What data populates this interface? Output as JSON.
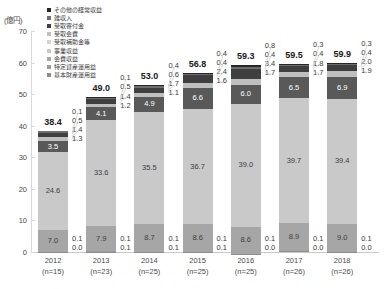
{
  "chart": {
    "type": "bar",
    "unit_label": "(億円)",
    "title": "",
    "xlabel": "",
    "ylabel": ""
  },
  "legend": {
    "items": [
      {
        "label": "その他の経常収益",
        "color": "#262626"
      },
      {
        "label": "雑収入",
        "color": "#6e6e6e"
      },
      {
        "label": "受取寄付金",
        "color": "#3f3f3f"
      },
      {
        "label": "受取会費",
        "color": "#bfbfbf"
      },
      {
        "label": "受取補助金等",
        "color": "#d4d4d4"
      },
      {
        "label": "事業収益",
        "color": "#c9c9c9"
      },
      {
        "label": "会費収益",
        "color": "#a6a6a6"
      },
      {
        "label": "特定資産運用益",
        "color": "#9c9c9c"
      },
      {
        "label": "基本財産運用益",
        "color": "#8c8c8c"
      }
    ]
  },
  "yaxis": {
    "min": 0,
    "max": 70,
    "ticks": [
      "0",
      "10",
      "20",
      "30",
      "40",
      "50",
      "60",
      "70"
    ]
  },
  "chart_data": {
    "type": "bar",
    "stacked": true,
    "title": "",
    "xlabel": "",
    "ylabel": "億円",
    "ylim": [
      0,
      70
    ],
    "grid": false,
    "legend_position": "top-left",
    "categories": [
      "2012",
      "2013",
      "2014",
      "2015",
      "2016",
      "2017",
      "2018"
    ],
    "category_sublabels": [
      "(n=15)",
      "(n=23)",
      "(n=25)",
      "(n=25)",
      "(n=25)",
      "(n=26)",
      "(n=26)"
    ],
    "totals": [
      38.4,
      49.0,
      53.0,
      56.8,
      59.3,
      59.5,
      59.9
    ],
    "series": [
      {
        "name": "基本財産運用益",
        "color": "#8c8c8c",
        "values": [
          0.1,
          0.1,
          0.1,
          0.1,
          0.1,
          0.1,
          0.1
        ]
      },
      {
        "name": "特定資産運用益",
        "color": "#9c9c9c",
        "values": [
          0.0,
          0.1,
          0.1,
          0.1,
          0.0,
          0.0,
          0.0
        ]
      },
      {
        "name": "会費収益",
        "color": "#a6a6a6",
        "values": [
          7.0,
          7.9,
          8.7,
          8.6,
          8.6,
          8.9,
          9.0
        ]
      },
      {
        "name": "事業収益",
        "color": "#c9c9c9",
        "values": [
          24.6,
          33.6,
          35.5,
          36.7,
          39.0,
          39.7,
          39.4
        ]
      },
      {
        "name": "受取補助金等",
        "color": "#595959",
        "values": [
          3.5,
          4.1,
          4.9,
          6.6,
          6.0,
          6.5,
          6.9
        ]
      },
      {
        "name": "受取会費",
        "color": "#bfbfbf",
        "values": [
          1.3,
          1.2,
          1.1,
          1.6,
          1.7,
          1.7,
          1.9
        ]
      },
      {
        "name": "受取寄付金",
        "color": "#3f3f3f",
        "values": [
          1.4,
          1.4,
          1.7,
          2.4,
          3.4,
          1.8,
          2.0
        ]
      },
      {
        "name": "雑収入",
        "color": "#6e6e6e",
        "values": [
          0.5,
          0.5,
          0.6,
          0.4,
          0.4,
          0.4,
          0.4
        ]
      },
      {
        "name": "その他の経常収益",
        "color": "#262626",
        "values": [
          0.1,
          0.1,
          0.4,
          0.4,
          0.8,
          0.3,
          0.3
        ]
      }
    ]
  },
  "bars": [
    {
      "year": "2012",
      "n": "(n=15)",
      "total": "38.4",
      "callouts_top": [
        "0.1",
        "0.5",
        "1.4",
        "1.3"
      ],
      "callouts_bottom": [
        "0.1",
        "0.0"
      ],
      "inner": {
        "big": "24.6",
        "fee": "7.0",
        "subsidy": "3.5"
      }
    },
    {
      "year": "2013",
      "n": "(n=23)",
      "total": "49.0",
      "callouts_top": [
        "0.1",
        "0.5",
        "1.4",
        "1.2"
      ],
      "callouts_bottom": [
        "0.1",
        "0.1"
      ],
      "inner": {
        "big": "33.6",
        "fee": "7.9",
        "subsidy": "4.1"
      }
    },
    {
      "year": "2014",
      "n": "(n=25)",
      "total": "53.0",
      "callouts_top": [
        "0.4",
        "0.6",
        "1.7",
        "1.1"
      ],
      "callouts_bottom": [
        "0.1",
        "0.1"
      ],
      "inner": {
        "big": "35.5",
        "fee": "8.7",
        "subsidy": "4.9"
      }
    },
    {
      "year": "2015",
      "n": "(n=25)",
      "total": "56.8",
      "callouts_top": [
        "0.4",
        "0.4",
        "2.4",
        "1.6"
      ],
      "callouts_bottom": [
        "0.1",
        "0.1"
      ],
      "inner": {
        "big": "36.7",
        "fee": "8.6",
        "subsidy": "6.6"
      }
    },
    {
      "year": "2016",
      "n": "(n=25)",
      "total": "59.3",
      "callouts_top": [
        "0.8",
        "0.4",
        "3.4",
        "1.7"
      ],
      "callouts_bottom": [
        "0.1",
        "0.0"
      ],
      "inner": {
        "big": "39.0",
        "fee": "8.6",
        "subsidy": "6.0"
      }
    },
    {
      "year": "2017",
      "n": "(n=26)",
      "total": "59.5",
      "callouts_top": [
        "0.3",
        "0.4",
        "1.8",
        "1.7"
      ],
      "callouts_bottom": [
        "0.1",
        "0.0"
      ],
      "inner": {
        "big": "39.7",
        "fee": "8.9",
        "subsidy": "6.5"
      }
    },
    {
      "year": "2018",
      "n": "(n=26)",
      "total": "59.9",
      "callouts_top": [
        "0.3",
        "0.4",
        "2.0",
        "1.9"
      ],
      "callouts_bottom": [
        "0.1",
        "0.0"
      ],
      "inner": {
        "big": "39.4",
        "fee": "9.0",
        "subsidy": "6.9"
      }
    }
  ]
}
